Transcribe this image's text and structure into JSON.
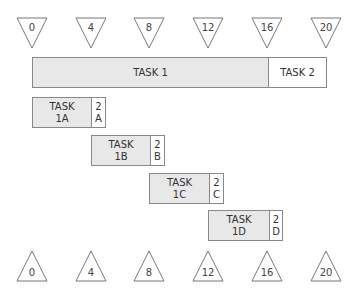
{
  "timeline_top": {
    "ticks": [
      "0",
      "4",
      "8",
      "12",
      "16",
      "20"
    ]
  },
  "timeline_bottom": {
    "ticks": [
      "0",
      "4",
      "8",
      "12",
      "16",
      "20"
    ]
  },
  "main_bar": {
    "task1": "TASK 1",
    "task2": "TASK 2"
  },
  "subtasks": [
    {
      "label_line1": "TASK",
      "label_line2": "1A",
      "next_line1": "2",
      "next_line2": "A"
    },
    {
      "label_line1": "TASK",
      "label_line2": "1B",
      "next_line1": "2",
      "next_line2": "B"
    },
    {
      "label_line1": "TASK",
      "label_line2": "1C",
      "next_line1": "2",
      "next_line2": "C"
    },
    {
      "label_line1": "TASK",
      "label_line2": "1D",
      "next_line1": "2",
      "next_line2": "D"
    }
  ],
  "colors": {
    "task_fill": "#e8e8e8",
    "outline": "#888888",
    "background": "#ffffff"
  }
}
